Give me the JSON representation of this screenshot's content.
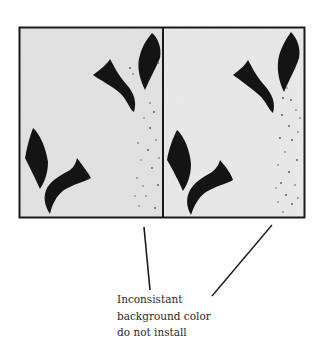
{
  "figure": {
    "panels": [
      {
        "name": "left-sample",
        "background": "#e6e6e6"
      },
      {
        "name": "right-sample",
        "background": "#ececec"
      }
    ],
    "colors": {
      "frame": "#1a1a1a",
      "leaf": "#141414",
      "speckle": "#555555"
    }
  },
  "caption": {
    "lines": [
      "Inconsistant",
      "background color",
      "do not install"
    ]
  }
}
